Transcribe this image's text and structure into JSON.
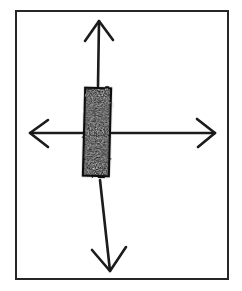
{
  "figure": {
    "title": "Hand-drawn diagram: vertical bar with four radiating arrows",
    "caption": "",
    "background_color": "#ffffff",
    "ink_color": "#1a1a1a",
    "frame": {
      "name": "border-rectangle",
      "x": 16,
      "y": 11,
      "width": 212,
      "height": 268,
      "stroke_width": 2,
      "stroke_color": "#262626",
      "fill": "none"
    },
    "bar": {
      "name": "central-vertical-bar",
      "label": "",
      "x": 84,
      "y": 88,
      "width": 26,
      "height": 88,
      "fill_color": "#111111",
      "texture": "rough-marker-speckle",
      "tilt_degrees": 1.5
    },
    "arrows": [
      {
        "name": "arrow-up",
        "direction": "up",
        "tail_x": 98,
        "tail_y": 86,
        "tip_x": 99,
        "tip_y": 21,
        "head_left_x": 85,
        "head_left_y": 41,
        "head_right_x": 113,
        "head_right_y": 40,
        "stroke_width": 2.6,
        "color": "#1a1a1a"
      },
      {
        "name": "arrow-down",
        "direction": "down",
        "tail_x": 100,
        "tail_y": 180,
        "tip_x": 110,
        "tip_y": 271,
        "head_left_x": 92,
        "head_left_y": 250,
        "head_right_x": 126,
        "head_right_y": 247,
        "stroke_width": 2.6,
        "color": "#1a1a1a"
      },
      {
        "name": "arrow-left",
        "direction": "left",
        "tail_x": 83,
        "tail_y": 133,
        "tip_x": 30,
        "tip_y": 133,
        "head_left_x": 48,
        "head_left_y": 120,
        "head_right_x": 48,
        "head_right_y": 147,
        "stroke_width": 2.6,
        "color": "#1a1a1a"
      },
      {
        "name": "arrow-right",
        "direction": "right",
        "tail_x": 112,
        "tail_y": 133,
        "tip_x": 215,
        "tip_y": 133,
        "head_left_x": 197,
        "head_left_y": 119,
        "head_right_x": 198,
        "head_right_y": 147,
        "stroke_width": 2.6,
        "color": "#1a1a1a"
      }
    ]
  }
}
